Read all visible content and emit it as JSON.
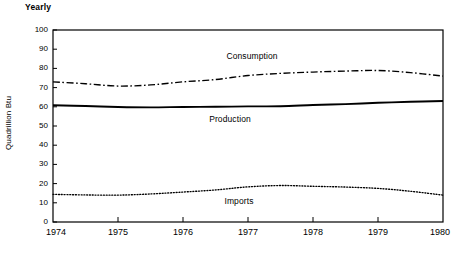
{
  "chart_data": {
    "type": "line",
    "title": "Yearly",
    "xlabel": "",
    "ylabel": "Quadrillion Btu",
    "xlim": [
      1974,
      1980
    ],
    "ylim": [
      0,
      100
    ],
    "grid": false,
    "legend_position": "inline-annotations",
    "x": [
      1974,
      1974.5,
      1975,
      1975.5,
      1976,
      1976.5,
      1977,
      1977.5,
      1978,
      1978.5,
      1979,
      1979.5,
      1980
    ],
    "xtick_labels": [
      "1974",
      "1975",
      "1976",
      "1977",
      "1978",
      "1979",
      "1980"
    ],
    "ytick_labels": [
      "0",
      "10",
      "20",
      "30",
      "40",
      "50",
      "60",
      "70",
      "80",
      "90",
      "100"
    ],
    "ytick_values": [
      0,
      10,
      20,
      30,
      40,
      50,
      60,
      70,
      80,
      90,
      100
    ],
    "series": [
      {
        "name": "Consumption",
        "style": "dash-dot",
        "color": "#000000",
        "annotation": "Consumption",
        "values": [
          73.0,
          72.0,
          70.8,
          71.4,
          73.0,
          74.2,
          76.3,
          77.4,
          78.1,
          78.6,
          78.9,
          77.8,
          76.0
        ]
      },
      {
        "name": "Production",
        "style": "solid",
        "color": "#000000",
        "annotation": "Production",
        "values": [
          60.8,
          60.4,
          59.9,
          59.7,
          59.9,
          60.0,
          60.2,
          60.3,
          60.9,
          61.4,
          62.1,
          62.6,
          63.0
        ]
      },
      {
        "name": "Imports",
        "style": "dotted",
        "color": "#000000",
        "annotation": "Imports",
        "values": [
          14.4,
          14.1,
          14.0,
          14.6,
          15.6,
          16.7,
          18.3,
          19.0,
          18.6,
          18.2,
          17.5,
          16.0,
          14.0
        ]
      }
    ]
  }
}
